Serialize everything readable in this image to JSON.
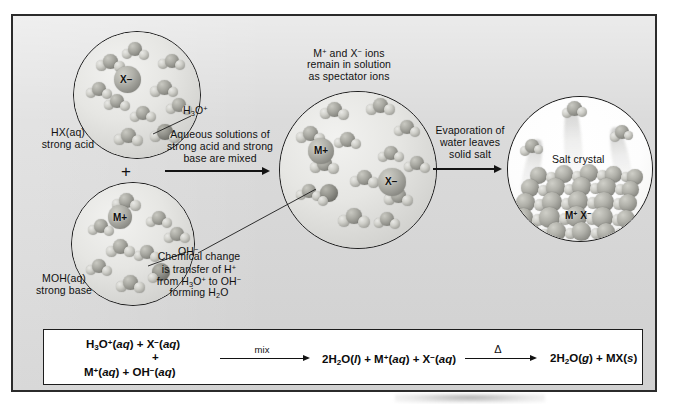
{
  "figure": {
    "background_color": "#d7d7d7",
    "frame_color": "#2b2b2b"
  },
  "labels": {
    "acid_name": "HX(aq)",
    "acid_desc": "strong acid",
    "base_name": "MOH(aq)",
    "base_desc": "strong base",
    "plus_between_reactants": "+",
    "hydronium_callout": "H3O+",
    "hydroxide_callout": "OH−",
    "spectator_note_line1": "M+ and X− ions",
    "spectator_note_line2": "remain in solution",
    "spectator_note_line3": "as spectator ions",
    "chemical_change_line1": "Chemical change",
    "chemical_change_line2": "is transfer of H+",
    "chemical_change_line3": "from H3O+ to OH−",
    "chemical_change_line4": "forming H2O",
    "salt_crystal": "Salt crystal",
    "ion_x_minus": "X−",
    "ion_m_plus": "M+",
    "crystal_ions": "M+ X−"
  },
  "arrows": [
    {
      "name": "mix-arrow",
      "caption_line1": "Aqueous solutions of",
      "caption_line2": "strong acid and strong",
      "caption_line3": "base are mixed"
    },
    {
      "name": "evaporation-arrow",
      "caption_line1": "Evaporation of",
      "caption_line2": "water leaves",
      "caption_line3": "solid salt"
    }
  ],
  "equation": {
    "reactant_line1": "H3O+(aq) + X−(aq)",
    "reactant_plus": "+",
    "reactant_line2": "M+(aq) + OH−(aq)",
    "arrow1_label": "mix",
    "product_mid": "2H2O(l) + M+(aq) + X−(aq)",
    "arrow2_label": "Δ",
    "product_final": "2H2O(g) + MX(s)"
  },
  "panels": [
    {
      "name": "acid-solution-circle",
      "contains": "H3O+ and X− ions in water"
    },
    {
      "name": "base-solution-circle",
      "contains": "M+ and OH− ions in water"
    },
    {
      "name": "mixed-solution-circle",
      "contains": "H2O molecules with M+ and X− spectator ions"
    },
    {
      "name": "salt-crystal-circle",
      "contains": "MX crystal lattice with evaporating water"
    }
  ]
}
